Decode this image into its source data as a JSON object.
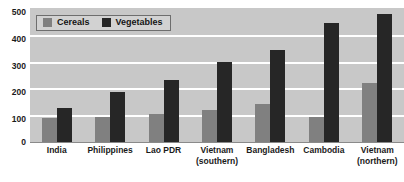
{
  "chart_data": {
    "type": "bar",
    "title": "",
    "subtitle": "",
    "xlabel": "",
    "ylabel": "",
    "ylim": [
      0,
      500
    ],
    "yticks": [
      0,
      100,
      200,
      300,
      400,
      500
    ],
    "grid": true,
    "grid_axis": "y",
    "legend_position": "top-left",
    "categories": [
      "India",
      "Philippines",
      "Lao PDR",
      "Vietnam (southern)",
      "Bangladesh",
      "Cambodia",
      "Vietnam (northern)"
    ],
    "category_lines": [
      [
        "India",
        ""
      ],
      [
        "Philippines",
        ""
      ],
      [
        "Lao PDR",
        ""
      ],
      [
        "Vietnam",
        "(southern)"
      ],
      [
        "Bangladesh",
        ""
      ],
      [
        "Cambodia",
        ""
      ],
      [
        "Vietnam",
        "(northern)"
      ]
    ],
    "series": [
      {
        "name": "Cereals",
        "color": "#808080",
        "values": [
          90,
          95,
          105,
          118,
          140,
          93,
          222
        ]
      },
      {
        "name": "Vegetables",
        "color": "#262626",
        "values": [
          127,
          185,
          232,
          300,
          345,
          443,
          478
        ]
      }
    ]
  },
  "legend": {
    "items": [
      {
        "label": "Cereals",
        "color": "#808080"
      },
      {
        "label": "Vegetables",
        "color": "#262626"
      }
    ]
  },
  "axes": {
    "y": {
      "ticks": [
        "500",
        "400",
        "300",
        "200",
        "100",
        "0"
      ]
    }
  },
  "cropped_top_text": "",
  "colors": {
    "plot_background": "#c8c8c8",
    "gridline": "#ffffff",
    "page_background": "#ffffff",
    "cereals": "#808080",
    "vegetables": "#262626"
  }
}
